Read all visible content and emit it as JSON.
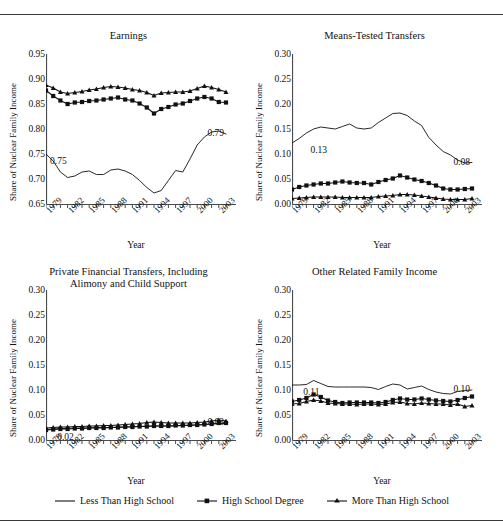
{
  "figure": {
    "clipped_header_text": "",
    "axis_y_label": "Share of Nuclear Family Income",
    "axis_x_label": "Year"
  },
  "legend": {
    "items": [
      {
        "label": "Less Than High School",
        "marker": "none",
        "icon": "line-swatch-icon"
      },
      {
        "label": "High School Degree",
        "marker": "square",
        "icon": "line-square-swatch-icon"
      },
      {
        "label": "More Than High School",
        "marker": "triangle",
        "icon": "line-triangle-swatch-icon"
      }
    ]
  },
  "chart_data": [
    {
      "id": "earnings",
      "type": "line",
      "title": "Earnings",
      "xlabel": "Year",
      "ylabel": "Share of Nuclear Family Income",
      "xlim": [
        1979,
        2004
      ],
      "ylim": [
        0.65,
        0.95
      ],
      "yticks": [
        "0.65",
        "0.70",
        "0.75",
        "0.80",
        "0.85",
        "0.90",
        "0.95"
      ],
      "ytick_values": [
        0.65,
        0.7,
        0.75,
        0.8,
        0.85,
        0.9,
        0.95
      ],
      "xticks": [
        "1979",
        "1982",
        "1985",
        "1988",
        "1991",
        "1994",
        "1997",
        "2000",
        "2003"
      ],
      "xtick_values": [
        1979,
        1982,
        1985,
        1988,
        1991,
        1994,
        1997,
        2000,
        2003
      ],
      "grid": false,
      "x": [
        1979,
        1980,
        1981,
        1982,
        1983,
        1984,
        1985,
        1986,
        1987,
        1988,
        1989,
        1990,
        1991,
        1992,
        1993,
        1994,
        1995,
        1996,
        1997,
        1998,
        1999,
        2000,
        2001,
        2002,
        2003,
        2004
      ],
      "series": [
        {
          "name": "Less Than High School",
          "marker": "none",
          "values": [
            0.75,
            0.736,
            0.714,
            0.703,
            0.706,
            0.714,
            0.716,
            0.709,
            0.709,
            0.718,
            0.72,
            0.716,
            0.709,
            0.697,
            0.683,
            0.672,
            0.677,
            0.697,
            0.717,
            0.714,
            0.74,
            0.768,
            0.784,
            0.794,
            0.796,
            0.79
          ]
        },
        {
          "name": "High School Degree",
          "marker": "square",
          "values": [
            0.877,
            0.866,
            0.857,
            0.85,
            0.853,
            0.854,
            0.856,
            0.857,
            0.859,
            0.861,
            0.863,
            0.859,
            0.857,
            0.851,
            0.843,
            0.831,
            0.84,
            0.844,
            0.849,
            0.851,
            0.856,
            0.861,
            0.864,
            0.861,
            0.854,
            0.853
          ]
        },
        {
          "name": "More Than High School",
          "marker": "triangle",
          "values": [
            0.888,
            0.882,
            0.874,
            0.871,
            0.873,
            0.875,
            0.878,
            0.88,
            0.883,
            0.885,
            0.884,
            0.882,
            0.879,
            0.877,
            0.873,
            0.867,
            0.872,
            0.873,
            0.874,
            0.874,
            0.876,
            0.881,
            0.886,
            0.883,
            0.879,
            0.874
          ]
        }
      ],
      "annotations": [
        {
          "text": "0.75",
          "x": 1979,
          "y": 0.75
        },
        {
          "text": "0.79",
          "x": 2004,
          "y": 0.79
        }
      ]
    },
    {
      "id": "means-tested-transfers",
      "type": "line",
      "title": "Means-Tested Transfers",
      "xlabel": "Year",
      "ylabel": "Share of Nuclear Family Income",
      "xlim": [
        1979,
        2004
      ],
      "ylim": [
        0.0,
        0.3
      ],
      "yticks": [
        "0.00",
        "0.05",
        "0.10",
        "0.15",
        "0.20",
        "0.25",
        "0.30"
      ],
      "ytick_values": [
        0.0,
        0.05,
        0.1,
        0.15,
        0.2,
        0.25,
        0.3
      ],
      "xticks": [
        "1979",
        "1982",
        "1985",
        "1988",
        "1991",
        "1994",
        "1997",
        "2000",
        "2003"
      ],
      "xtick_values": [
        1979,
        1982,
        1985,
        1988,
        1991,
        1994,
        1997,
        2000,
        2003
      ],
      "grid": false,
      "x": [
        1979,
        1980,
        1981,
        1982,
        1983,
        1984,
        1985,
        1986,
        1987,
        1988,
        1989,
        1990,
        1991,
        1992,
        1993,
        1994,
        1995,
        1996,
        1997,
        1998,
        1999,
        2000,
        2001,
        2002,
        2003,
        2004
      ],
      "series": [
        {
          "name": "Less Than High School",
          "marker": "none",
          "values": [
            0.122,
            0.131,
            0.142,
            0.15,
            0.154,
            0.152,
            0.15,
            0.155,
            0.16,
            0.152,
            0.15,
            0.152,
            0.163,
            0.172,
            0.181,
            0.182,
            0.177,
            0.166,
            0.157,
            0.133,
            0.118,
            0.105,
            0.098,
            0.088,
            0.082,
            0.083
          ]
        },
        {
          "name": "High School Degree",
          "marker": "square",
          "values": [
            0.029,
            0.034,
            0.037,
            0.039,
            0.041,
            0.041,
            0.043,
            0.045,
            0.043,
            0.042,
            0.042,
            0.039,
            0.044,
            0.048,
            0.051,
            0.057,
            0.053,
            0.049,
            0.046,
            0.042,
            0.037,
            0.031,
            0.029,
            0.029,
            0.03,
            0.031
          ]
        },
        {
          "name": "More Than High School",
          "marker": "triangle",
          "values": [
            0.011,
            0.012,
            0.013,
            0.014,
            0.014,
            0.014,
            0.014,
            0.013,
            0.013,
            0.013,
            0.013,
            0.013,
            0.015,
            0.016,
            0.017,
            0.019,
            0.019,
            0.018,
            0.016,
            0.014,
            0.012,
            0.01,
            0.009,
            0.009,
            0.009,
            0.011
          ]
        }
      ],
      "annotations": [
        {
          "text": "0.13",
          "x": 1981,
          "y": 0.122
        },
        {
          "text": "0.08",
          "x": 2004,
          "y": 0.083
        }
      ]
    },
    {
      "id": "private-financial-transfers",
      "type": "line",
      "title": "Private Financial Transfers, Including Alimony and Child Support",
      "title_lines": [
        "Private Financial Transfers, Including",
        "Alimony and Child Support"
      ],
      "xlabel": "Year",
      "ylabel": "Share of Nuclear Family Income",
      "xlim": [
        1979,
        2004
      ],
      "ylim": [
        0.0,
        0.3
      ],
      "yticks": [
        "0.00",
        "0.05",
        "0.10",
        "0.15",
        "0.20",
        "0.25",
        "0.30"
      ],
      "ytick_values": [
        0.0,
        0.05,
        0.1,
        0.15,
        0.2,
        0.25,
        0.3
      ],
      "xticks": [
        "1979",
        "1982",
        "1985",
        "1988",
        "1991",
        "1994",
        "1997",
        "2000",
        "2003"
      ],
      "xtick_values": [
        1979,
        1982,
        1985,
        1988,
        1991,
        1994,
        1997,
        2000,
        2003
      ],
      "grid": false,
      "x": [
        1979,
        1980,
        1981,
        1982,
        1983,
        1984,
        1985,
        1986,
        1987,
        1988,
        1989,
        1990,
        1991,
        1992,
        1993,
        1994,
        1995,
        1996,
        1997,
        1998,
        1999,
        2000,
        2001,
        2002,
        2003,
        2004
      ],
      "series": [
        {
          "name": "Less Than High School",
          "marker": "none",
          "values": [
            0.021,
            0.022,
            0.023,
            0.023,
            0.024,
            0.024,
            0.024,
            0.025,
            0.025,
            0.025,
            0.026,
            0.026,
            0.027,
            0.027,
            0.028,
            0.028,
            0.028,
            0.028,
            0.028,
            0.029,
            0.029,
            0.03,
            0.031,
            0.032,
            0.033,
            0.033
          ]
        },
        {
          "name": "High School Degree",
          "marker": "square",
          "values": [
            0.02,
            0.021,
            0.022,
            0.022,
            0.023,
            0.023,
            0.024,
            0.024,
            0.024,
            0.025,
            0.025,
            0.026,
            0.026,
            0.027,
            0.027,
            0.028,
            0.028,
            0.028,
            0.029,
            0.029,
            0.03,
            0.03,
            0.031,
            0.032,
            0.034,
            0.034
          ]
        },
        {
          "name": "More Than High School",
          "marker": "triangle",
          "values": [
            0.024,
            0.025,
            0.026,
            0.026,
            0.027,
            0.027,
            0.028,
            0.028,
            0.029,
            0.029,
            0.03,
            0.031,
            0.032,
            0.033,
            0.035,
            0.036,
            0.035,
            0.034,
            0.034,
            0.034,
            0.034,
            0.035,
            0.036,
            0.038,
            0.04,
            0.038
          ]
        }
      ],
      "annotations": [
        {
          "text": "0.02",
          "x": 1980,
          "y": 0.021
        },
        {
          "text": "0.03",
          "x": 2004,
          "y": 0.034
        }
      ]
    },
    {
      "id": "other-related-family-income",
      "type": "line",
      "title": "Other Related Family Income",
      "xlabel": "Year",
      "ylabel": "Share of Nuclear Family Income",
      "xlim": [
        1979,
        2004
      ],
      "ylim": [
        0.0,
        0.3
      ],
      "yticks": [
        "0.00",
        "0.05",
        "0.10",
        "0.15",
        "0.20",
        "0.25",
        "0.30"
      ],
      "ytick_values": [
        0.0,
        0.05,
        0.1,
        0.15,
        0.2,
        0.25,
        0.3
      ],
      "xticks": [
        "1979",
        "1982",
        "1985",
        "1988",
        "1991",
        "1994",
        "1997",
        "2000",
        "2003"
      ],
      "xtick_values": [
        1979,
        1982,
        1985,
        1988,
        1991,
        1994,
        1997,
        2000,
        2003
      ],
      "grid": false,
      "x": [
        1979,
        1980,
        1981,
        1982,
        1983,
        1984,
        1985,
        1986,
        1987,
        1988,
        1989,
        1990,
        1991,
        1992,
        1993,
        1994,
        1995,
        1996,
        1997,
        1998,
        1999,
        2000,
        2001,
        2002,
        2003,
        2004
      ],
      "series": [
        {
          "name": "Less Than High School",
          "marker": "none",
          "values": [
            0.11,
            0.11,
            0.111,
            0.119,
            0.113,
            0.107,
            0.106,
            0.106,
            0.106,
            0.106,
            0.106,
            0.105,
            0.101,
            0.107,
            0.112,
            0.11,
            0.102,
            0.105,
            0.108,
            0.101,
            0.096,
            0.093,
            0.092,
            0.097,
            0.099,
            0.1
          ]
        },
        {
          "name": "High School Degree",
          "marker": "square",
          "values": [
            0.077,
            0.08,
            0.084,
            0.091,
            0.086,
            0.079,
            0.076,
            0.074,
            0.075,
            0.075,
            0.075,
            0.075,
            0.074,
            0.076,
            0.08,
            0.083,
            0.081,
            0.081,
            0.083,
            0.081,
            0.079,
            0.078,
            0.077,
            0.08,
            0.084,
            0.087
          ]
        },
        {
          "name": "More Than High School",
          "marker": "triangle",
          "values": [
            0.072,
            0.073,
            0.077,
            0.08,
            0.078,
            0.074,
            0.073,
            0.072,
            0.072,
            0.071,
            0.072,
            0.072,
            0.071,
            0.072,
            0.075,
            0.076,
            0.073,
            0.072,
            0.074,
            0.073,
            0.072,
            0.072,
            0.07,
            0.072,
            0.067,
            0.069
          ]
        }
      ],
      "annotations": [
        {
          "text": "0.11",
          "x": 1980,
          "y": 0.11
        },
        {
          "text": "0.10",
          "x": 2004,
          "y": 0.1
        }
      ]
    }
  ]
}
